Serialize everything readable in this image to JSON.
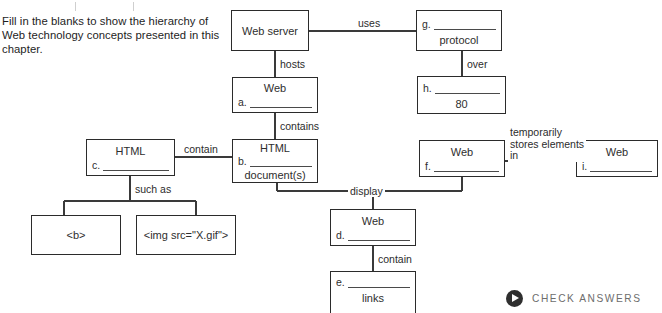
{
  "instructions": {
    "text": "Fill in the blanks to show the hierarchy of Web technology concepts presented in this chapter."
  },
  "diagram": {
    "type": "hierarchy-fill-in-the-blank",
    "nodes": [
      {
        "id": "web-server",
        "center_label": "Web server",
        "letter": "",
        "blank": true,
        "sub_label": ""
      },
      {
        "id": "protocol",
        "center_label": "",
        "letter": "g.",
        "blank": true,
        "sub_label": "protocol"
      },
      {
        "id": "web-a",
        "center_label": "Web",
        "letter": "a.",
        "blank": true,
        "sub_label": ""
      },
      {
        "id": "port-80",
        "center_label": "",
        "letter": "h.",
        "blank": true,
        "sub_label": "80"
      },
      {
        "id": "html-c",
        "center_label": "HTML",
        "letter": "c.",
        "blank": true,
        "sub_label": ""
      },
      {
        "id": "html-b",
        "center_label": "HTML",
        "letter": "b.",
        "blank": true,
        "sub_label": "document(s)"
      },
      {
        "id": "web-f",
        "center_label": "Web",
        "letter": "f.",
        "blank": true,
        "sub_label": ""
      },
      {
        "id": "web-i",
        "center_label": "Web",
        "letter": "i.",
        "blank": true,
        "sub_label": ""
      },
      {
        "id": "tag-b",
        "center_label": "<b>",
        "letter": "",
        "blank": false,
        "sub_label": ""
      },
      {
        "id": "tag-img",
        "center_label": "<img src=\"X.gif\">",
        "letter": "",
        "blank": false,
        "sub_label": ""
      },
      {
        "id": "web-d",
        "center_label": "Web",
        "letter": "d.",
        "blank": true,
        "sub_label": ""
      },
      {
        "id": "links-e",
        "center_label": "",
        "letter": "e.",
        "blank": true,
        "sub_label": "links"
      }
    ],
    "edge_labels": [
      {
        "id": "uses",
        "text": "uses"
      },
      {
        "id": "over",
        "text": "over"
      },
      {
        "id": "hosts",
        "text": "hosts"
      },
      {
        "id": "contains",
        "text": "contains"
      },
      {
        "id": "contain-1",
        "text": "contain"
      },
      {
        "id": "such-as",
        "text": "such as"
      },
      {
        "id": "stores",
        "text": "temporarily\nstores elements\nin"
      },
      {
        "id": "display",
        "text": "display"
      },
      {
        "id": "contain-2",
        "text": "contain"
      }
    ]
  },
  "footer": {
    "check_answers_label": "CHECK ANSWERS",
    "play_icon": "play-icon"
  },
  "colors": {
    "box_border": "#2b2b2b",
    "text": "#2a2a2a",
    "wire": "#3a3a3a",
    "button_circle": "#2f2f2f",
    "button_text": "#6d6d6d",
    "background": "#ffffff"
  }
}
